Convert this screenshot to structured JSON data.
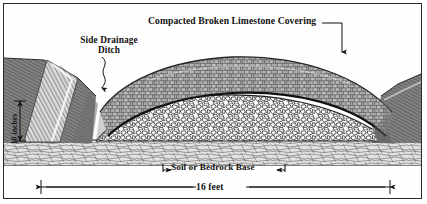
{
  "figure": {
    "border_color": "#2b2b2b",
    "background_color": "#ffffff"
  },
  "labels": {
    "limestone": "Compacted Broken Limestone Covering",
    "ditch_line1": "Side Drainage",
    "ditch_line2": "Ditch",
    "base": "Soil or Bedrock Base",
    "width": "16 feet",
    "depth": "10 inches"
  },
  "dimensions": {
    "road_width": "16 feet",
    "covering_depth": "10 inches"
  },
  "layers": [
    {
      "name": "compacted-broken-limestone-covering",
      "tone": "#9a9a9a",
      "description": "upper crowned layer of compacted broken limestone"
    },
    {
      "name": "coarse-aggregate-base-course",
      "tone": "#f2f2f2",
      "description": "lower layer of coarse angular white stone"
    },
    {
      "name": "soil-or-bedrock-base",
      "tone": "#d9d9d9",
      "description": "horizontal banded soil and bedrock strata"
    },
    {
      "name": "side-drainage-ditch",
      "tone": "#8e8e8e",
      "description": "hatched earth embankment with drainage channel"
    }
  ],
  "colors": {
    "ink": "#121212",
    "limestone_fill": "#a3a3a3",
    "limestone_stroke": "#4a4a4a",
    "aggregate_fill": "#fbfbfb",
    "aggregate_stroke": "#2e2e2e",
    "soil_fill": "#dedede",
    "soil_stroke": "#5d5d5d",
    "bank_fill": "#8a8a8a",
    "bank_stroke": "#3a3a3a"
  }
}
